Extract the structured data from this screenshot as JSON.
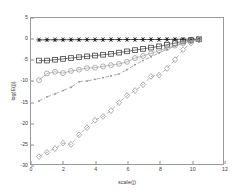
{
  "figure": {
    "background": "#ffffff",
    "axis_color": "#9a9a9a",
    "tick_text_color": "#3a3a3a"
  },
  "axes": {
    "xlabel": "scale(j)",
    "ylabel": "log(E(j))",
    "xticks": [
      "0",
      "2",
      "4",
      "6",
      "8",
      "10",
      "12"
    ],
    "yticks": [
      "5",
      "0",
      "-5",
      "-10",
      "-15",
      "-20",
      "-25",
      "-30"
    ]
  },
  "chart_data": {
    "type": "line",
    "title": "",
    "xlabel": "scale(j)",
    "ylabel": "log(E(j))",
    "xlim": [
      0,
      12
    ],
    "ylim": [
      -30,
      5
    ],
    "xticks": [
      0,
      2,
      4,
      6,
      8,
      10,
      12
    ],
    "yticks": [
      5,
      0,
      -5,
      -10,
      -15,
      -20,
      -25,
      -30
    ],
    "grid": false,
    "legend": "none",
    "series": [
      {
        "name": "series-1",
        "marker": "star",
        "color": "#1a1a1a",
        "linestyle": "solid",
        "x": [
          0.5,
          1.0,
          1.5,
          2.0,
          2.5,
          3.0,
          3.5,
          4.0,
          4.5,
          5.0,
          5.5,
          6.0,
          6.5,
          7.0,
          7.5,
          8.0,
          8.5,
          9.0,
          9.5,
          10.0,
          10.5
        ],
        "y": [
          -0.25,
          -0.22,
          -0.22,
          -0.2,
          -0.2,
          -0.2,
          -0.18,
          -0.18,
          -0.18,
          -0.17,
          -0.17,
          -0.16,
          -0.16,
          -0.15,
          -0.15,
          -0.14,
          -0.13,
          -0.12,
          -0.1,
          -0.08,
          -0.05
        ]
      },
      {
        "name": "series-2",
        "marker": "square",
        "color": "#3c3c3c",
        "linestyle": "solid",
        "x": [
          0.5,
          1.0,
          1.5,
          2.0,
          2.5,
          3.0,
          3.5,
          4.0,
          4.5,
          5.0,
          5.5,
          6.0,
          6.5,
          7.0,
          7.5,
          8.0,
          8.5,
          9.0,
          9.5,
          10.0,
          10.5
        ],
        "y": [
          -5.2,
          -5.2,
          -5.0,
          -4.8,
          -4.6,
          -4.4,
          -4.2,
          -4.0,
          -3.8,
          -3.6,
          -3.3,
          -3.0,
          -2.7,
          -2.4,
          -2.1,
          -1.8,
          -1.4,
          -1.0,
          -0.6,
          -0.3,
          -0.1
        ]
      },
      {
        "name": "series-3",
        "marker": "circle",
        "color": "#9c9c9c",
        "linestyle": "solid",
        "x": [
          0.5,
          1.0,
          1.5,
          2.0,
          2.5,
          3.0,
          3.5,
          4.0,
          4.5,
          5.0,
          5.5,
          6.0,
          6.5,
          7.0,
          7.5,
          8.0,
          8.5,
          9.0,
          9.5,
          10.0,
          10.5
        ],
        "y": [
          -9.9,
          -8.3,
          -7.9,
          -8.2,
          -7.7,
          -7.4,
          -7.0,
          -6.9,
          -6.6,
          -6.3,
          -6.0,
          -5.5,
          -4.6,
          -4.1,
          -3.5,
          -2.8,
          -2.2,
          -1.6,
          -1.0,
          -0.5,
          -0.2
        ]
      },
      {
        "name": "series-4",
        "marker": "dot",
        "color": "#8a8a8a",
        "linestyle": "dashdot",
        "x": [
          0.5,
          1.0,
          1.5,
          2.0,
          2.5,
          3.0,
          3.5,
          4.0,
          4.5,
          5.0,
          5.5,
          6.0,
          6.5,
          7.0,
          7.5,
          8.0,
          8.5,
          9.0,
          9.5,
          10.0,
          10.5
        ],
        "y": [
          -14.9,
          -13.9,
          -13.2,
          -12.4,
          -11.6,
          -10.3,
          -10.1,
          -9.7,
          -9.3,
          -8.9,
          -8.4,
          -7.4,
          -6.2,
          -5.2,
          -4.3,
          -3.4,
          -2.5,
          -1.7,
          -1.0,
          -0.5,
          -0.2
        ]
      },
      {
        "name": "series-5",
        "marker": "diamond",
        "color": "#9c9c9c",
        "linestyle": "dashed",
        "x": [
          0.5,
          1.0,
          1.5,
          2.0,
          2.5,
          3.0,
          3.5,
          4.0,
          4.5,
          5.0,
          5.5,
          6.0,
          6.5,
          7.0,
          7.5,
          8.0,
          8.5,
          9.0,
          9.5,
          10.0,
          10.5
        ],
        "y": [
          -28.2,
          -27.2,
          -26.3,
          -25.0,
          -25.3,
          -23.0,
          -21.3,
          -19.5,
          -18.6,
          -17.2,
          -15.3,
          -13.6,
          -12.4,
          -11.0,
          -9.0,
          -8.7,
          -7.1,
          -5.0,
          -2.6,
          -1.0,
          -0.3
        ]
      }
    ]
  }
}
